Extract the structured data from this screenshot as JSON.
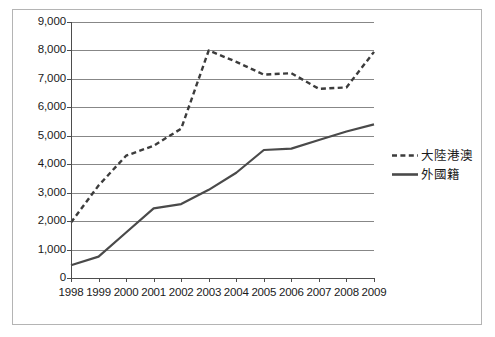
{
  "chart_data": {
    "type": "line",
    "title": "",
    "subtitle": "",
    "xlabel": "",
    "ylabel": "",
    "x": [
      1998,
      1999,
      2000,
      2001,
      2002,
      2003,
      2004,
      2005,
      2006,
      2007,
      2008,
      2009
    ],
    "categories": [
      "1998",
      "1999",
      "2000",
      "2001",
      "2002",
      "2003",
      "2004",
      "2005",
      "2006",
      "2007",
      "2008",
      "2009"
    ],
    "series": [
      {
        "name": "大陸港澳",
        "style": "dashed",
        "color": "#3c3c3c",
        "values": [
          1950,
          3250,
          4300,
          4650,
          5250,
          8000,
          7600,
          7150,
          7200,
          6650,
          6700,
          7950
        ]
      },
      {
        "name": "外國籍",
        "style": "solid",
        "color": "#4a4a4a",
        "values": [
          450,
          750,
          1600,
          2450,
          2600,
          3100,
          3700,
          4500,
          4550,
          4850,
          5150,
          5400
        ]
      }
    ],
    "ylim": [
      0,
      9000
    ],
    "ytick_values": [
      0,
      1000,
      2000,
      3000,
      4000,
      5000,
      6000,
      7000,
      8000,
      9000
    ],
    "ytick_labels": [
      "0",
      "1,000",
      "2,000",
      "3,000",
      "4,000",
      "5,000",
      "6,000",
      "7,000",
      "8,000",
      "9,000"
    ],
    "xlim": [
      1998,
      2009
    ],
    "grid": "horizontal",
    "legend_position": "right",
    "legend": [
      "大陸港澳",
      "外國籍"
    ],
    "annotations": []
  },
  "figure": {
    "border_color": "#b4b4b4",
    "grid_color": "#878787",
    "axis_color": "#4d4d4d",
    "background": "#ffffff"
  }
}
